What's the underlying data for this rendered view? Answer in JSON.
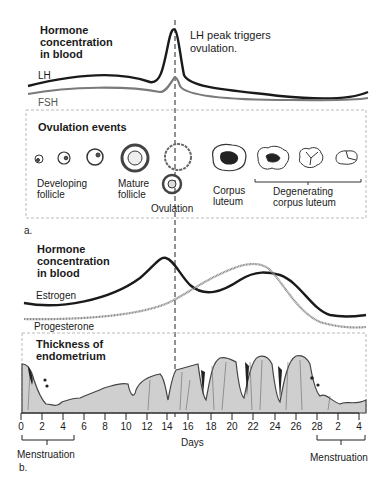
{
  "panel_a": {
    "hormone_heading": [
      "Hormone",
      "concentration",
      "in blood"
    ],
    "annotation": [
      "LH peak triggers",
      "ovulation."
    ],
    "curves": {
      "lh_label": "LH",
      "fsh_label": "FSH"
    },
    "ovulation_box": {
      "title": "Ovulation events",
      "labels": {
        "developing": [
          "Developing",
          "follicle"
        ],
        "mature": [
          "Mature",
          "follicle"
        ],
        "ovulation": "Ovulation",
        "corpus_luteum": [
          "Corpus",
          "luteum"
        ],
        "degenerating": [
          "Degenerating",
          "corpus luteum"
        ]
      }
    },
    "panel_label": "a."
  },
  "panel_b": {
    "hormone_heading": [
      "Hormone",
      "concentration",
      "in blood"
    ],
    "curves": {
      "estrogen_label": "Estrogen",
      "progesterone_label": "Progesterone"
    },
    "endometrium_heading": [
      "Thickness of",
      "endometrium"
    ],
    "axis": {
      "ticks": [
        "0",
        "2",
        "4",
        "6",
        "8",
        "10",
        "12",
        "14",
        "16",
        "18",
        "20",
        "22",
        "24",
        "26",
        "28",
        "2",
        "4"
      ],
      "xlabel": "Days"
    },
    "menstruation_left": "Menstruation",
    "menstruation_right": "Menstruation",
    "panel_label": "b."
  },
  "colors": {
    "lh": "#1a1a1a",
    "fsh": "#7a7a7a",
    "estrogen": "#1a1a1a",
    "progesterone": "#8a8a8a",
    "tissue": "#c8c8c8"
  }
}
